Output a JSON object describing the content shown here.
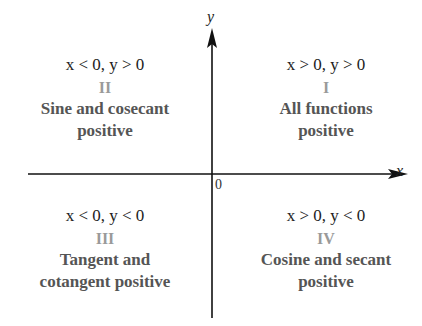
{
  "axes": {
    "x_label": "x",
    "y_label": "y",
    "origin_label": "0"
  },
  "quadrants": [
    {
      "id": "II",
      "condition": "x < 0, y > 0",
      "numeral": "II",
      "description_line1": "Sine and cosecant",
      "description_line2": "positive"
    },
    {
      "id": "I",
      "condition": "x > 0, y > 0",
      "numeral": "I",
      "description_line1": "All functions",
      "description_line2": "positive"
    },
    {
      "id": "III",
      "condition": "x < 0, y < 0",
      "numeral": "III",
      "description_line1": "Tangent and",
      "description_line2": "cotangent positive"
    },
    {
      "id": "IV",
      "condition": "x > 0, y < 0",
      "numeral": "IV",
      "description_line1": "Cosine and secant",
      "description_line2": "positive"
    }
  ],
  "colors": {
    "axis": "#111111",
    "numeral": "#9a9a9a",
    "description": "#555555"
  }
}
